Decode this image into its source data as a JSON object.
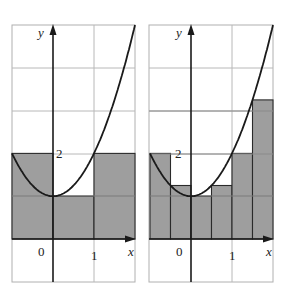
{
  "figure": {
    "function": "y = x^2 + 1",
    "panels": [
      {
        "id": "left",
        "description": "Left-endpoint Riemann sum, n = 3",
        "x_range": [
          -1,
          2
        ],
        "y_range": [
          -1,
          5
        ],
        "axis_labels": {
          "x": "x",
          "y": "y"
        },
        "tick_labels": {
          "origin": "0",
          "x1": "1",
          "y2": "2"
        },
        "rectangles": [
          {
            "x0": -1,
            "x1": 0,
            "height": 2
          },
          {
            "x0": 0,
            "x1": 1,
            "height": 1
          },
          {
            "x0": 1,
            "x1": 2,
            "height": 2
          }
        ]
      },
      {
        "id": "right",
        "description": "Left-endpoint Riemann sum, n = 6",
        "x_range": [
          -1,
          2
        ],
        "y_range": [
          -1,
          5
        ],
        "axis_labels": {
          "x": "x",
          "y": "y"
        },
        "tick_labels": {
          "origin": "0",
          "x1": "1",
          "y2": "2"
        },
        "rectangles": [
          {
            "x0": -1,
            "x1": -0.5,
            "height": 2
          },
          {
            "x0": -0.5,
            "x1": 0,
            "height": 1.25
          },
          {
            "x0": 0,
            "x1": 0.5,
            "height": 1
          },
          {
            "x0": 0.5,
            "x1": 1,
            "height": 1.25
          },
          {
            "x0": 1,
            "x1": 1.5,
            "height": 2
          },
          {
            "x0": 1.5,
            "x1": 2,
            "height": 3.25
          }
        ]
      }
    ],
    "colors": {
      "shade": "#9e9e9e",
      "grid": "#b8b8b8",
      "ink": "#1a1a1a"
    }
  }
}
